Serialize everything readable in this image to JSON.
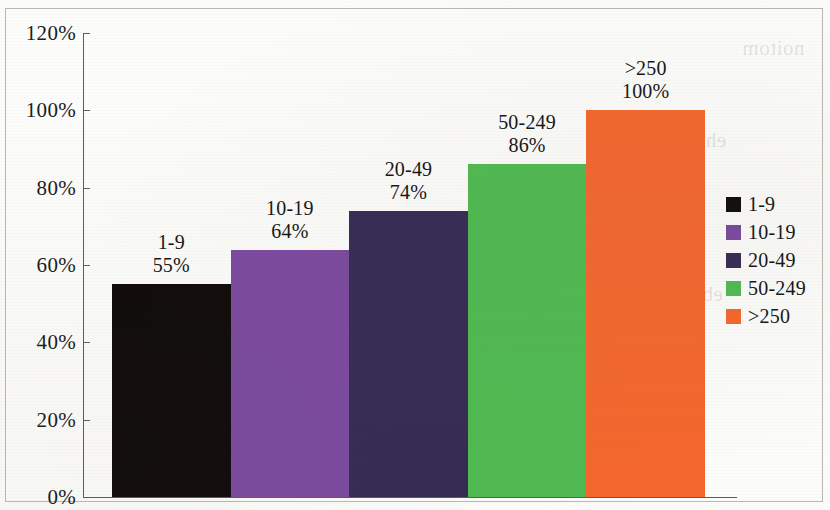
{
  "chart_data": {
    "type": "bar",
    "title": "",
    "subtitle": "",
    "xlabel": "",
    "ylabel": "",
    "categories": [
      "1-9",
      "10-19",
      "20-49",
      "50-249",
      ">250"
    ],
    "values": [
      55,
      64,
      74,
      86,
      100
    ],
    "value_labels": [
      "55%",
      "64%",
      "74%",
      "86%",
      "100%"
    ],
    "colors": [
      "#100b0b",
      "#7b4a9f",
      "#362b54",
      "#50ba51",
      "#f4672e"
    ],
    "ylim": [
      0,
      120
    ],
    "yticks": [
      0,
      20,
      40,
      60,
      80,
      100,
      120
    ],
    "ytick_labels": [
      "0%",
      "20%",
      "40%",
      "60%",
      "80%",
      "100%",
      "120%"
    ],
    "grid": false,
    "legend_position": "right",
    "legend": [
      "1-9",
      "10-19",
      "20-49",
      "50-249",
      ">250"
    ],
    "bar_gap": 0,
    "units": "percent"
  },
  "axis": {
    "ticks": [
      {
        "label": "120%",
        "value": 120
      },
      {
        "label": "100%",
        "value": 100
      },
      {
        "label": "80%",
        "value": 80
      },
      {
        "label": "60%",
        "value": 60
      },
      {
        "label": "40%",
        "value": 40
      },
      {
        "label": "20%",
        "value": 20
      },
      {
        "label": "0%",
        "value": 0
      }
    ]
  },
  "bars": [
    {
      "category": "1-9",
      "value": 55,
      "label_line1": "1-9",
      "label_line2": "55%",
      "color": "#100b0b"
    },
    {
      "category": "10-19",
      "value": 64,
      "label_line1": "10-19",
      "label_line2": "64%",
      "color": "#7b4a9f"
    },
    {
      "category": "20-49",
      "value": 74,
      "label_line1": "20-49",
      "label_line2": "74%",
      "color": "#362b54"
    },
    {
      "category": "50-249",
      "value": 86,
      "label_line1": "50-249",
      "label_line2": "86%",
      "color": "#50ba51"
    },
    {
      "category": ">250",
      "value": 100,
      "label_line1": ">250",
      "label_line2": "100%",
      "color": "#f4672e"
    }
  ],
  "legend": {
    "items": [
      {
        "label": "1-9",
        "color": "#100b0b"
      },
      {
        "label": "10-19",
        "color": "#7b4a9f"
      },
      {
        "label": "20-49",
        "color": "#362b54"
      },
      {
        "label": "50-249",
        "color": "#50ba51"
      },
      {
        "label": ">250",
        "color": "#f4672e"
      }
    ]
  },
  "background_bleed": [
    {
      "text": "noitom",
      "x": 742,
      "y": 36
    },
    {
      "text": "eht ni",
      "x": 676,
      "y": 128
    },
    {
      "text": "commun",
      "x": 626,
      "y": 152
    },
    {
      "text": "owt eht",
      "x": 612,
      "y": 178
    },
    {
      "text": "eraperp",
      "x": 618,
      "y": 204
    },
    {
      "text": "self Prot",
      "x": 606,
      "y": 230
    },
    {
      "text": "lanoitan",
      "x": 616,
      "y": 256
    },
    {
      "text": "eb",
      "x": 702,
      "y": 282
    },
    {
      "text": "seitiroirp",
      "x": 604,
      "y": 308
    },
    {
      "text": "mumixam",
      "x": 610,
      "y": 334
    },
    {
      "text": "a no tcapmi",
      "x": 600,
      "y": 360
    },
    {
      "text": "elbissop",
      "x": 616,
      "y": 386
    }
  ]
}
